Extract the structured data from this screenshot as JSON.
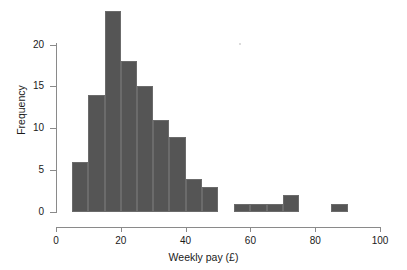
{
  "figure": {
    "background_color": "#ffffff",
    "bar_color": "#555555",
    "bar_edge_color": "#6b6b6b",
    "axis_color": "#8a8a8a",
    "text_color": "#1a1a1a"
  },
  "chart_data": {
    "type": "bar",
    "subtype": "histogram",
    "title": "",
    "xlabel": "Weekly pay (£)",
    "ylabel": "Frequency",
    "xlim": [
      0,
      100
    ],
    "ylim": [
      0,
      24
    ],
    "xticks": [
      0,
      20,
      40,
      60,
      80,
      100
    ],
    "xtick_labels": [
      "0",
      "20",
      "40",
      "60",
      "80",
      "100"
    ],
    "yticks": [
      0,
      5,
      10,
      15,
      20
    ],
    "ytick_labels": [
      "0",
      "5",
      "10",
      "15",
      "20"
    ],
    "grid": false,
    "legend": null,
    "bin_width": 5,
    "bins": [
      {
        "left": 5,
        "right": 10,
        "value": 6
      },
      {
        "left": 10,
        "right": 15,
        "value": 14
      },
      {
        "left": 15,
        "right": 20,
        "value": 24
      },
      {
        "left": 20,
        "right": 25,
        "value": 18
      },
      {
        "left": 25,
        "right": 30,
        "value": 15
      },
      {
        "left": 30,
        "right": 35,
        "value": 11
      },
      {
        "left": 35,
        "right": 40,
        "value": 9
      },
      {
        "left": 40,
        "right": 45,
        "value": 4
      },
      {
        "left": 45,
        "right": 50,
        "value": 3
      },
      {
        "left": 55,
        "right": 60,
        "value": 1
      },
      {
        "left": 60,
        "right": 65,
        "value": 1
      },
      {
        "left": 65,
        "right": 70,
        "value": 1
      },
      {
        "left": 70,
        "right": 75,
        "value": 2
      },
      {
        "left": 85,
        "right": 90,
        "value": 1
      }
    ],
    "categories": [
      "5-10",
      "10-15",
      "15-20",
      "20-25",
      "25-30",
      "30-35",
      "35-40",
      "40-45",
      "45-50",
      "55-60",
      "60-65",
      "65-70",
      "70-75",
      "85-90"
    ],
    "values": [
      6,
      14,
      24,
      18,
      15,
      11,
      9,
      4,
      3,
      1,
      1,
      1,
      2,
      1
    ]
  }
}
